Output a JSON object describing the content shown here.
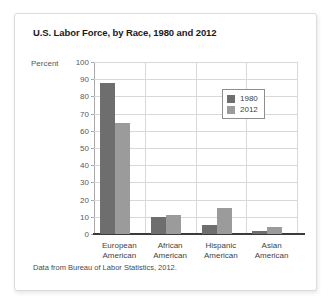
{
  "chart_data": {
    "type": "bar",
    "title": "U.S. Labor Force, by Race, 1980 and 2012",
    "xlabel": "",
    "ylabel": "Percent",
    "ylim": [
      0,
      100
    ],
    "ytick_step": 10,
    "yticks": [
      "100",
      "90",
      "80",
      "70",
      "60",
      "50",
      "40",
      "30",
      "20",
      "10",
      "0"
    ],
    "grid": true,
    "legend_position": "upper-right-inside",
    "categories": [
      "European\nAmerican",
      "African\nAmerican",
      "Hispanic\nAmerican",
      "Asian\nAmerican"
    ],
    "category_labels": [
      {
        "line1": "European",
        "line2": "American"
      },
      {
        "line1": "African",
        "line2": "American"
      },
      {
        "line1": "Hispanic",
        "line2": "American"
      },
      {
        "line1": "Asian",
        "line2": "American"
      }
    ],
    "series": [
      {
        "name": "1980",
        "color": "#6e6e6e",
        "values": [
          88,
          10,
          5,
          1.5
        ]
      },
      {
        "name": "2012",
        "color": "#9b9b9b",
        "values": [
          64.5,
          11,
          15,
          4
        ]
      }
    ],
    "source_note": "Data from Bureau of Labor Statistics, 2012."
  },
  "colors": {
    "series_1980": "#6e6e6e",
    "series_2012": "#9b9b9b",
    "gridline": "#d8d8d8",
    "axis": "#3b3b3b",
    "card_border": "#dcdcdc",
    "title_text": "#1a1a1a",
    "tick_text": "#59595b"
  }
}
